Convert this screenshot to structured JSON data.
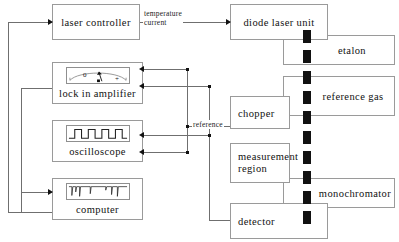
{
  "diagram": {
    "type": "block-diagram",
    "colors": {
      "box_border": "#9a9a9a",
      "line": "#6f6f6f",
      "beam": "#111111",
      "text": "#111111",
      "background": "#ffffff"
    },
    "blocks": [
      {
        "id": "laser_controller",
        "label": "laser controller"
      },
      {
        "id": "diode_laser_unit",
        "label": "diode laser unit"
      },
      {
        "id": "etalon",
        "label": "etalon"
      },
      {
        "id": "lock_in_amplifier",
        "label": "lock in amplifier"
      },
      {
        "id": "reference_gas",
        "label": "reference gas"
      },
      {
        "id": "chopper",
        "label": "chopper"
      },
      {
        "id": "oscilloscope",
        "label": "oscilloscope"
      },
      {
        "id": "measurement_region",
        "label": "measurement\nregion"
      },
      {
        "id": "monochromator",
        "label": "monochromator"
      },
      {
        "id": "computer",
        "label": "computer"
      },
      {
        "id": "detector",
        "label": "detector"
      }
    ],
    "edge_labels": [
      {
        "id": "temperature_current",
        "label": "temperature\ncurrent"
      },
      {
        "id": "reference",
        "label": "reference"
      }
    ],
    "meter": {
      "zero_label": "0",
      "plus_label": "+"
    },
    "beam": {
      "name": "laser-beam",
      "style": "thick dashed vertical line",
      "color": "#111111"
    }
  }
}
